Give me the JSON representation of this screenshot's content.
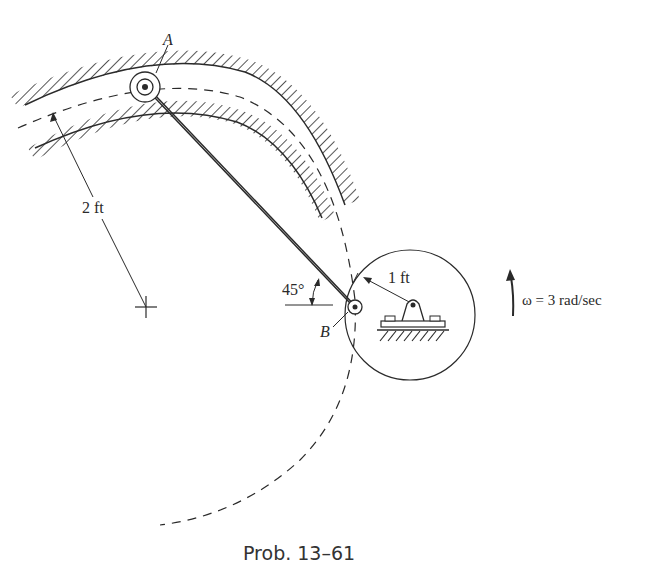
{
  "figure": {
    "caption": "Prob. 13–61",
    "labels": {
      "point_a": "A",
      "point_b": "B",
      "slot_radius": "2 ft",
      "disk_radius": "1 ft",
      "angle": "45°",
      "angular_velocity": "ω = 3 rad/sec"
    },
    "elements": {
      "curved_slot": "circular guide slot, radius 2 ft, cross-hatched walls",
      "link_ab": "straight rod connecting pin A (in slot) to pin B (on disk)",
      "disk": "circular disk, radius 1 ft, pinned to ground at its center",
      "ground_support": "pin support on hatched ground",
      "rotation_arrow": "counterclockwise angular velocity arrow"
    },
    "colors": {
      "ink": "#2a2a2a",
      "background": "#ffffff"
    }
  }
}
